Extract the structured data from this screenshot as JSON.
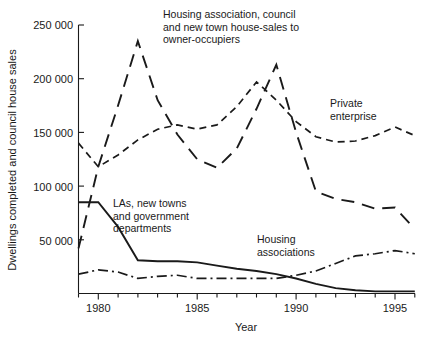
{
  "chart_data": {
    "type": "line",
    "title": "",
    "xlabel": "Year",
    "ylabel": "Dwellings completed and council house sales",
    "xlim": [
      1979,
      1996
    ],
    "ylim": [
      0,
      250000
    ],
    "xticks": [
      1979,
      1980,
      1981,
      1982,
      1983,
      1984,
      1985,
      1986,
      1987,
      1988,
      1989,
      1990,
      1991,
      1992,
      1993,
      1994,
      1995,
      1996
    ],
    "xticklabels": [
      "1980",
      "1985",
      "1990",
      "1995"
    ],
    "xticklabel_values": [
      1980,
      1985,
      1990,
      1995
    ],
    "yticks": [
      50000,
      100000,
      150000,
      200000,
      250000
    ],
    "yticklabels": [
      "50 000",
      "100 000",
      "150 000",
      "200 000",
      "250 000"
    ],
    "grid": false,
    "legend": "inline-annotations",
    "x": [
      1979,
      1980,
      1981,
      1982,
      1983,
      1984,
      1985,
      1986,
      1987,
      1988,
      1989,
      1990,
      1991,
      1992,
      1993,
      1994,
      1995,
      1996
    ],
    "series": [
      {
        "name": "Private enterprise",
        "style": "short-dashed",
        "label": "Private enterprise",
        "values": [
          140000,
          118000,
          129000,
          143000,
          153000,
          157000,
          153000,
          157000,
          174000,
          197000,
          180000,
          160000,
          146000,
          141000,
          142000,
          147000,
          155000,
          147000
        ]
      },
      {
        "name": "Housing association, council and new town house-sales to owner-occupiers",
        "style": "long-dashed",
        "label": "Housing association, council and new town house-sales to owner-occupiers",
        "values": [
          42000,
          118000,
          175000,
          235000,
          180000,
          148000,
          125000,
          117000,
          135000,
          172000,
          213000,
          150000,
          95000,
          88000,
          85000,
          79000,
          80000,
          60000
        ]
      },
      {
        "name": "LAs, new towns and government departments",
        "style": "solid",
        "label": "LAs, new towns and government departments",
        "values": [
          85000,
          85000,
          62000,
          31000,
          30000,
          30000,
          29000,
          26000,
          23000,
          21000,
          18000,
          14000,
          9000,
          5000,
          3000,
          2000,
          2000,
          2000
        ]
      },
      {
        "name": "Housing associations",
        "style": "dash-dot",
        "label": "Housing associations",
        "values": [
          18000,
          22000,
          20000,
          14000,
          16000,
          17000,
          14000,
          14000,
          14000,
          14000,
          14000,
          17000,
          21000,
          28000,
          35000,
          37000,
          40000,
          37000
        ]
      }
    ],
    "annotations": [
      {
        "name": "housing-association-sales-label",
        "lines": [
          "Housing association, council",
          "and new town house-sales to",
          "owner-occupiers"
        ]
      },
      {
        "name": "private-enterprise-label",
        "lines": [
          "Private",
          "enterprise"
        ]
      },
      {
        "name": "las-new-towns-label",
        "lines": [
          "LAs, new towns",
          "and government",
          "departments"
        ]
      },
      {
        "name": "housing-associations-label",
        "lines": [
          "Housing",
          "associations"
        ]
      }
    ],
    "colors": {
      "ink": "#1a1a1a",
      "background": "#ffffff"
    }
  }
}
